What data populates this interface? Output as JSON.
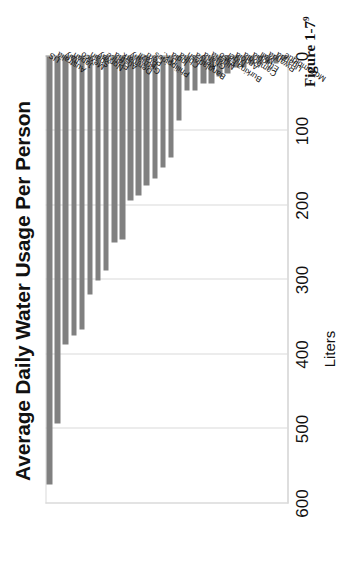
{
  "chart_data": {
    "type": "bar",
    "orientation": "vertical",
    "title": "Average Daily Water Usage Per Person",
    "xlabel": "",
    "ylabel": "Liters",
    "ylim": [
      0,
      600
    ],
    "yticks": [
      0,
      100,
      200,
      300,
      400,
      500,
      600
    ],
    "grid": true,
    "legend": null,
    "bar_color": "#808080",
    "categories": [
      "US",
      "Australia",
      "Italy",
      "Japan",
      "Mexico",
      "Spain",
      "Norway",
      "France",
      "Austria",
      "Denmark",
      "Germany",
      "Brazil",
      "Peru",
      "Philippines",
      "U.K.",
      "India",
      "China",
      "Bangladesh",
      "Kenya",
      "Ghana",
      "Nigeria",
      "Burkina Faso",
      "Niger",
      "Angola",
      "Cambodia",
      "Ethiopia",
      "Mali",
      "Rwanda",
      "Uganda",
      "Mozambique"
    ],
    "values": [
      575,
      493,
      386,
      374,
      366,
      320,
      301,
      287,
      250,
      246,
      193,
      187,
      173,
      164,
      149,
      135,
      86,
      46,
      46,
      36,
      36,
      27,
      23,
      15,
      15,
      11,
      11,
      9,
      9,
      4
    ]
  },
  "caption": {
    "label": "Figure 1-7",
    "footnote": "9"
  },
  "axis": {
    "value_axis_title": "Liters"
  }
}
